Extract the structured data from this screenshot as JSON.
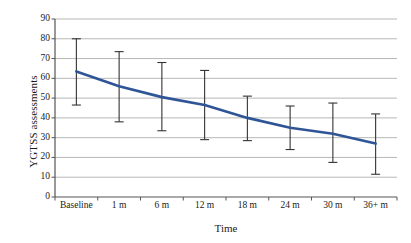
{
  "chart_data": {
    "type": "line",
    "title": "",
    "subtitle": "",
    "xlabel": "Time",
    "ylabel": "YGTSS assessments",
    "categories": [
      "Baseline",
      "1 m",
      "6 m",
      "12 m",
      "18 m",
      "24 m",
      "30 m",
      "36+ m"
    ],
    "values": [
      63.5,
      56.0,
      50.5,
      46.5,
      40.0,
      35.0,
      32.0,
      27.0
    ],
    "series": [
      {
        "name": "YGTSS assessments",
        "color": "#2F5597",
        "values": [
          63.5,
          56.0,
          50.5,
          46.5,
          40.0,
          35.0,
          32.0,
          27.0
        ],
        "error_upper": [
          80.0,
          73.5,
          68.0,
          64.0,
          51.0,
          46.0,
          47.5,
          42.0
        ],
        "error_lower": [
          46.5,
          38.0,
          33.5,
          29.0,
          28.5,
          24.0,
          17.5,
          11.5
        ]
      }
    ],
    "ylim": [
      0,
      90
    ],
    "ytick_step": 10,
    "yticks": [
      0,
      10,
      20,
      30,
      40,
      50,
      60,
      70,
      80,
      90
    ],
    "ytick_labels": [
      "0",
      "10",
      "20",
      "30",
      "40",
      "50",
      "60",
      "70",
      "80",
      "90"
    ],
    "grid": {
      "horizontal": true,
      "vertical": false,
      "color": "#9a9a9a"
    },
    "legend": {
      "visible": false,
      "position": "none",
      "entries": []
    },
    "error_bars": {
      "visible": true,
      "color": "#333333",
      "cap_width_px": 9
    },
    "axis_color": "#555555",
    "plot_background": "#ffffff",
    "annotations": []
  }
}
